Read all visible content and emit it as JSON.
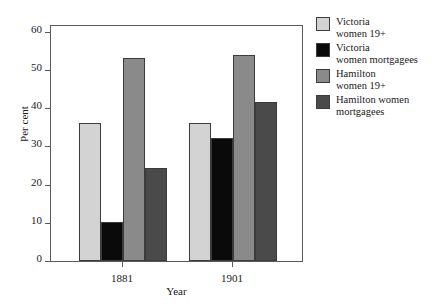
{
  "chart_data": {
    "type": "bar",
    "title": "",
    "xlabel": "Year",
    "ylabel": "Per cent",
    "categories": [
      "1881",
      "1901"
    ],
    "ylim": [
      0,
      62
    ],
    "yticks": [
      0,
      10,
      20,
      30,
      40,
      50,
      60
    ],
    "ytick_labels": [
      "0",
      "10",
      "20",
      "30",
      "40",
      "50",
      "60"
    ],
    "grid": false,
    "legend_position": "right",
    "series": [
      {
        "name": "Victoria women 19+",
        "legend_line1": "Victoria",
        "legend_line2": "women 19+",
        "color": "#d3d3d3",
        "values": [
          36,
          36
        ]
      },
      {
        "name": "Victoria women mortgagees",
        "legend_line1": "Victoria",
        "legend_line2": "women mortgagees",
        "color": "#0a0a0a",
        "values": [
          10.3,
          32.3
        ]
      },
      {
        "name": "Hamilton women 19+",
        "legend_line1": "Hamilton",
        "legend_line2": "women 19+",
        "color": "#8a8a8a",
        "values": [
          53,
          54
        ]
      },
      {
        "name": "Hamilton women mortgagees",
        "legend_line1": "Hamilton women",
        "legend_line2": "mortgagees",
        "color": "#4a4a4a",
        "values": [
          24.3,
          41.5
        ]
      }
    ]
  }
}
